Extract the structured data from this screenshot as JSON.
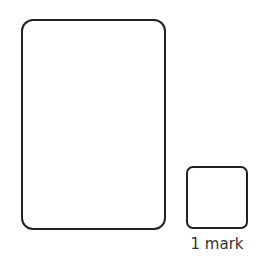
{
  "diagram": {
    "large_box": {
      "shape": "rounded-rectangle"
    },
    "small_box": {
      "shape": "rounded-square",
      "label": "1 mark"
    },
    "colors": {
      "stroke": "#222222",
      "background": "#ffffff",
      "text": "#333333"
    }
  }
}
